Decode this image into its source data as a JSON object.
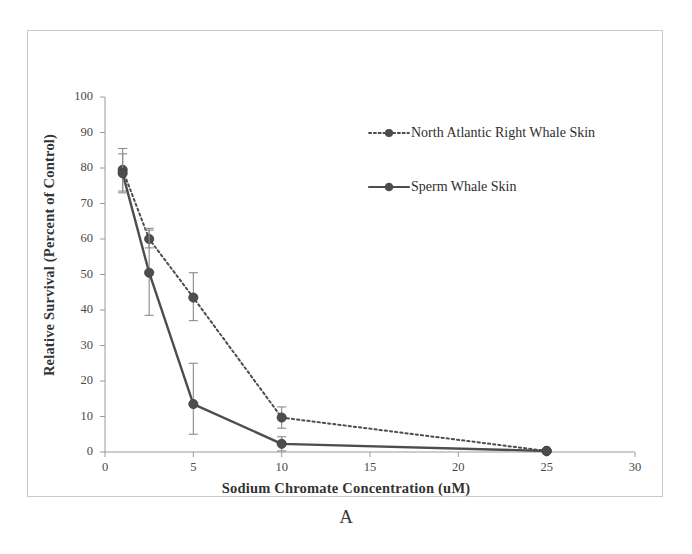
{
  "figure": {
    "panel_label": "A"
  },
  "legend": {
    "position": "inside-top-right",
    "entries": [
      {
        "label": "North Atlantic Right Whale Skin",
        "style": "dotted",
        "marker": "circle-marker",
        "color": "#4d4d4d"
      },
      {
        "label": "Sperm Whale Skin",
        "style": "solid",
        "marker": "circle-marker",
        "color": "#4d4d4d"
      }
    ]
  },
  "chart_data": {
    "type": "line",
    "title": "",
    "subtitle": "",
    "xlabel": "Sodium Chromate Concentration (uM)",
    "ylabel": "Relative Survival (Percent of Control)",
    "xlim": [
      0,
      30
    ],
    "ylim": [
      0,
      100
    ],
    "xticks": [
      0,
      5,
      10,
      15,
      20,
      25,
      30
    ],
    "yticks": [
      0,
      10,
      20,
      30,
      40,
      50,
      60,
      70,
      80,
      90,
      100
    ],
    "xtick_labels": [
      "0",
      "5",
      "10",
      "15",
      "20",
      "25",
      "30"
    ],
    "ytick_labels": [
      "0",
      "10",
      "20",
      "30",
      "40",
      "50",
      "60",
      "70",
      "80",
      "90",
      "100"
    ],
    "grid": false,
    "legend_position": "inside-top-right",
    "annotations": [
      "A"
    ],
    "series": [
      {
        "name": "North Atlantic Right Whale Skin",
        "linestyle": "dotted",
        "marker": "circle",
        "color": "#4d4d4d",
        "x": [
          1,
          2.5,
          5,
          10,
          25
        ],
        "values": [
          79.5,
          60.0,
          43.5,
          9.7,
          0.3
        ],
        "error_low": [
          6.0,
          2.5,
          6.5,
          3.0,
          0.3
        ],
        "error_high": [
          6.0,
          3.0,
          7.0,
          3.0,
          0.3
        ]
      },
      {
        "name": "Sperm Whale Skin",
        "linestyle": "solid",
        "marker": "circle",
        "color": "#4d4d4d",
        "x": [
          1,
          2.5,
          5,
          10,
          25
        ],
        "values": [
          78.5,
          50.5,
          13.5,
          2.3,
          0.3
        ],
        "error_low": [
          5.5,
          12.0,
          8.5,
          2.0,
          0.3
        ],
        "error_high": [
          5.5,
          12.0,
          11.5,
          2.0,
          0.3
        ]
      }
    ]
  },
  "colors": {
    "frame": "#c9c9c9",
    "axis": "#9a9a9a",
    "series": "#4d4d4d",
    "text": "#333333"
  }
}
